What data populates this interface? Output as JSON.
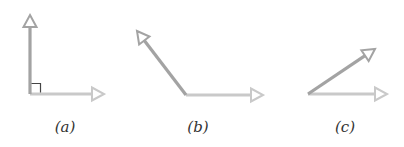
{
  "figure": {
    "type": "angle-diagram",
    "colors": {
      "arrow_primary": "#a3a3a3",
      "arrow_secondary": "#c9c9c9",
      "right_angle_marker": "#444444",
      "label": "#333333"
    },
    "panels": [
      {
        "id": "a",
        "label": "(a)",
        "angle_type": "right",
        "vertex": [
          30,
          94
        ],
        "arrow1_tip": [
          30,
          15
        ],
        "arrow2_tip": [
          104,
          94
        ],
        "label_pos": [
          65,
          118
        ]
      },
      {
        "id": "b",
        "label": "(b)",
        "angle_type": "obtuse",
        "vertex": [
          186,
          95
        ],
        "arrow1_tip": [
          137,
          31
        ],
        "arrow2_tip": [
          263,
          95
        ],
        "label_pos": [
          198,
          118
        ]
      },
      {
        "id": "c",
        "label": "(c)",
        "angle_type": "acute",
        "vertex": [
          308,
          94
        ],
        "arrow1_tip": [
          375,
          49
        ],
        "arrow2_tip": [
          387,
          94
        ],
        "label_pos": [
          345,
          118
        ]
      }
    ]
  }
}
